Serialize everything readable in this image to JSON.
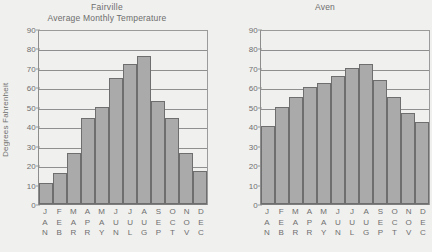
{
  "chart_data": [
    {
      "type": "bar",
      "title": "Fairville",
      "subtitle": "Average Monthly Temperature",
      "xlabel": "",
      "ylabel": "Degrees Fahrenheit",
      "categories": [
        "JAN",
        "FEB",
        "MAR",
        "APR",
        "MAY",
        "JUN",
        "JUL",
        "AUG",
        "SEP",
        "OCT",
        "NOV",
        "DEC"
      ],
      "values": [
        11,
        16,
        26,
        44,
        50,
        65,
        72,
        76,
        53,
        44,
        26,
        17
      ],
      "ylim": [
        0,
        90
      ],
      "yticks": [
        0,
        10,
        20,
        30,
        40,
        50,
        60,
        70,
        80,
        90
      ],
      "grid": true,
      "legend": "none",
      "bar_color": "#aaaaaa",
      "bar_border_color": "#6e6e6e"
    },
    {
      "type": "bar",
      "title": "",
      "subtitle": "Aven",
      "xlabel": "",
      "ylabel": "",
      "categories": [
        "JAN",
        "FEB",
        "MAR",
        "APR",
        "MAY",
        "JUN",
        "JUL",
        "AUG",
        "SEP",
        "OCT",
        "NOV",
        "DEC"
      ],
      "values": [
        40,
        50,
        55,
        60,
        62,
        66,
        70,
        72,
        64,
        55,
        47,
        42
      ],
      "ylim": [
        0,
        90
      ],
      "yticks": [
        0,
        10,
        20,
        30,
        40,
        50,
        60,
        70,
        80,
        90
      ],
      "grid": true,
      "legend": "none",
      "bar_color": "#aaaaaa",
      "bar_border_color": "#6e6e6e"
    }
  ],
  "page": {
    "background_color": "#f0f0ee",
    "text_color": "#6f6f6f"
  }
}
